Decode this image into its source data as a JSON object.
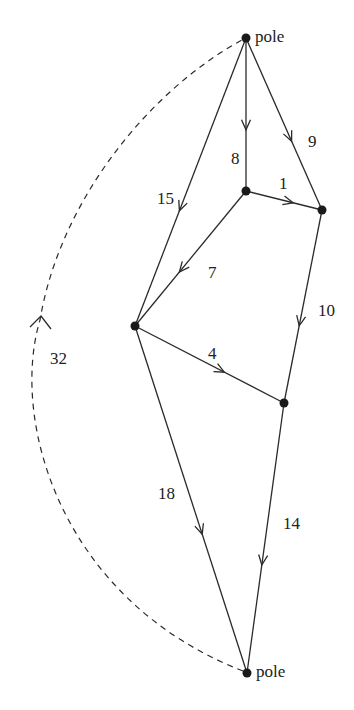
{
  "diagram": {
    "type": "directed-graph",
    "nodes": [
      {
        "id": "pole-top",
        "label": "pole",
        "x": 246,
        "y": 38
      },
      {
        "id": "inner",
        "label": "",
        "x": 246,
        "y": 191
      },
      {
        "id": "right",
        "label": "",
        "x": 322,
        "y": 210
      },
      {
        "id": "left",
        "label": "",
        "x": 135,
        "y": 326
      },
      {
        "id": "mid-right",
        "label": "",
        "x": 284,
        "y": 403
      },
      {
        "id": "pole-bottom",
        "label": "pole",
        "x": 247,
        "y": 673
      }
    ],
    "edges": [
      {
        "from": "pole-top",
        "to": "inner",
        "weight": "8",
        "label_x": 231,
        "label_y": 150
      },
      {
        "from": "pole-top",
        "to": "right",
        "weight": "9",
        "label_x": 308,
        "label_y": 133
      },
      {
        "from": "pole-top",
        "to": "left",
        "weight": "15",
        "label_x": 157,
        "label_y": 190
      },
      {
        "from": "inner",
        "to": "right",
        "weight": "1",
        "label_x": 279,
        "label_y": 175
      },
      {
        "from": "inner",
        "to": "left",
        "weight": "7",
        "label_x": 208,
        "label_y": 264
      },
      {
        "from": "right",
        "to": "mid-right",
        "weight": "10",
        "label_x": 318,
        "label_y": 302
      },
      {
        "from": "left",
        "to": "mid-right",
        "weight": "4",
        "label_x": 208,
        "label_y": 345
      },
      {
        "from": "left",
        "to": "pole-bottom",
        "weight": "18",
        "label_x": 158,
        "label_y": 485
      },
      {
        "from": "mid-right",
        "to": "pole-bottom",
        "weight": "14",
        "label_x": 283,
        "label_y": 515
      }
    ],
    "return_edge": {
      "from": "pole-bottom",
      "to": "pole-top",
      "weight": "32",
      "style": "dashed",
      "label_x": 50,
      "label_y": 350
    },
    "colors": {
      "line": "#2a2a2a",
      "node": "#1a1a1a",
      "background": "#ffffff"
    }
  }
}
